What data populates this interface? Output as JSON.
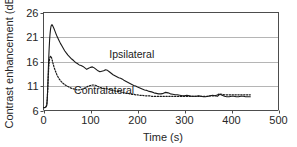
{
  "chart_data": {
    "type": "line",
    "title": "",
    "xlabel": "Time (s)",
    "ylabel": "Contrast enhancement (dB)",
    "xlim": [
      0,
      500
    ],
    "ylim": [
      6,
      26
    ],
    "xticks": [
      0,
      100,
      200,
      300,
      400,
      500
    ],
    "yticks": [
      6,
      11,
      16,
      21,
      26
    ],
    "grid": "horizontal",
    "legend_position": "inline-annotations",
    "annotations": [
      {
        "name": "ipsilateral-label",
        "text": "Ipsilateral",
        "x": 140,
        "y": 16.8
      },
      {
        "name": "contralateral-label",
        "text": "Contralateral",
        "x": 65,
        "y": 9.3
      }
    ],
    "series": [
      {
        "name": "Ipsilateral",
        "style": "solid",
        "color": "#1a1a1a",
        "x": [
          0,
          3,
          5,
          7,
          8,
          9,
          10,
          11,
          12,
          13,
          14,
          15,
          16,
          17,
          18,
          19,
          20,
          22,
          24,
          26,
          28,
          30,
          33,
          36,
          39,
          42,
          45,
          48,
          52,
          56,
          60,
          64,
          68,
          72,
          76,
          80,
          84,
          88,
          92,
          96,
          100,
          104,
          108,
          112,
          116,
          120,
          124,
          128,
          132,
          136,
          140,
          144,
          148,
          152,
          156,
          160,
          164,
          168,
          172,
          176,
          180,
          184,
          188,
          192,
          196,
          200,
          205,
          210,
          215,
          220,
          225,
          230,
          235,
          240,
          245,
          250,
          255,
          260,
          265,
          270,
          275,
          280,
          285,
          290,
          295,
          300,
          305,
          310,
          315,
          320,
          325,
          330,
          335,
          340,
          345,
          350,
          355,
          360,
          365,
          370,
          375,
          380,
          385,
          390,
          395,
          400,
          405,
          410,
          415,
          420,
          425,
          430,
          435,
          440
        ],
        "y": [
          6.6,
          6.6,
          6.7,
          7.1,
          8.4,
          10.6,
          13.6,
          16.4,
          18.6,
          20.4,
          21.7,
          22.6,
          23.2,
          23.4,
          23.5,
          23.4,
          23.2,
          22.8,
          22.3,
          21.8,
          21.3,
          20.9,
          20.3,
          19.7,
          19.2,
          18.7,
          18.2,
          17.8,
          17.3,
          16.9,
          16.5,
          16.2,
          15.8,
          15.6,
          15.3,
          15.2,
          15.0,
          14.7,
          14.4,
          14.6,
          14.8,
          14.9,
          14.7,
          14.4,
          14.1,
          13.9,
          14.0,
          14.1,
          14.3,
          14.2,
          13.9,
          13.6,
          13.3,
          13.1,
          12.9,
          12.7,
          12.6,
          12.4,
          12.1,
          11.9,
          11.7,
          11.5,
          11.3,
          11.1,
          11.0,
          10.8,
          10.6,
          10.4,
          10.2,
          10.1,
          9.9,
          9.8,
          9.6,
          9.5,
          9.4,
          9.4,
          9.5,
          9.7,
          9.6,
          9.4,
          9.3,
          9.2,
          9.2,
          9.1,
          9.0,
          9.0,
          9.1,
          9.0,
          8.9,
          8.9,
          8.9,
          9.0,
          8.9,
          8.8,
          8.8,
          8.9,
          9.0,
          9.1,
          9.0,
          8.9,
          9.3,
          9.1,
          8.9,
          8.8,
          8.8,
          8.9,
          8.9,
          8.8,
          8.8,
          8.9,
          8.9,
          8.8,
          8.8,
          8.8
        ]
      },
      {
        "name": "Contralateral",
        "style": "dotted",
        "color": "#1a1a1a",
        "x": [
          0,
          3,
          5,
          7,
          8,
          9,
          10,
          11,
          12,
          13,
          14,
          15,
          16,
          17,
          18,
          19,
          20,
          22,
          24,
          26,
          28,
          30,
          33,
          36,
          39,
          42,
          45,
          48,
          52,
          56,
          60,
          64,
          68,
          72,
          76,
          80,
          84,
          88,
          92,
          96,
          100,
          104,
          108,
          112,
          116,
          120,
          124,
          128,
          132,
          136,
          140,
          144,
          148,
          152,
          156,
          160,
          164,
          168,
          172,
          176,
          180,
          184,
          188,
          192,
          196,
          200,
          205,
          210,
          215,
          220,
          225,
          230,
          235,
          240,
          245,
          250,
          255,
          260,
          265,
          270,
          275,
          280,
          285,
          290,
          295,
          300,
          305,
          310,
          315,
          320,
          325,
          330,
          335,
          340,
          345,
          350,
          355,
          360,
          365,
          370,
          375,
          380,
          385,
          390,
          395,
          400,
          405,
          410,
          415,
          420,
          425,
          430,
          435,
          440
        ],
        "y": [
          6.6,
          6.6,
          6.7,
          7.1,
          8.3,
          10.2,
          12.6,
          14.5,
          15.8,
          16.5,
          16.9,
          17.1,
          17.0,
          16.8,
          16.5,
          16.1,
          15.7,
          15.0,
          14.4,
          13.9,
          13.4,
          13.0,
          12.5,
          12.1,
          11.8,
          11.5,
          11.3,
          11.1,
          10.9,
          10.7,
          10.5,
          10.4,
          10.3,
          10.2,
          10.2,
          10.3,
          10.4,
          10.6,
          10.8,
          11.0,
          11.1,
          11.2,
          11.2,
          11.1,
          10.9,
          10.7,
          10.6,
          10.5,
          10.5,
          10.4,
          10.3,
          10.2,
          10.1,
          10.0,
          9.9,
          9.9,
          9.8,
          9.7,
          9.6,
          9.5,
          9.5,
          9.4,
          9.3,
          9.3,
          9.2,
          9.2,
          9.1,
          9.1,
          9.0,
          9.0,
          9.0,
          8.9,
          8.9,
          8.9,
          8.9,
          8.9,
          8.9,
          8.9,
          8.9,
          8.9,
          8.9,
          8.9,
          8.9,
          8.9,
          8.9,
          8.9,
          8.9,
          8.9,
          8.9,
          8.9,
          8.9,
          8.9,
          8.9,
          8.9,
          8.9,
          8.9,
          9.0,
          9.0,
          9.0,
          9.2,
          9.4,
          9.3,
          9.2,
          9.2,
          9.2,
          9.2,
          9.2,
          9.2,
          9.2,
          9.2,
          9.2,
          9.2,
          9.2,
          9.2
        ]
      }
    ],
    "colors": {
      "axis": "#4d4d4d",
      "grid": "#b5b5b5",
      "text": "#262626",
      "background": "#ffffff"
    }
  }
}
